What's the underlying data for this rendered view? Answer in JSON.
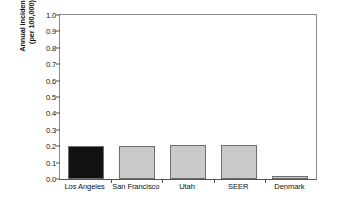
{
  "chart_data": {
    "type": "bar",
    "title": "",
    "xlabel": "",
    "ylabel": "Annual incidence (per 100,000)",
    "ylabel_line1": "Annual incidence",
    "ylabel_line2": "(per 100,000)",
    "categories": [
      "Los Angeles",
      "San Francisco",
      "Utah",
      "SEER",
      "Denmark"
    ],
    "values": [
      0.2,
      0.2,
      0.205,
      0.21,
      0.02
    ],
    "ylim": [
      0.0,
      1.0
    ],
    "ytick_labels": [
      "0.0",
      "0.1",
      "0.2",
      "0.3",
      "0.4",
      "0.5",
      "0.6",
      "0.7",
      "0.8",
      "0.9",
      "1.0"
    ],
    "ytick_values": [
      0.0,
      0.1,
      0.2,
      0.3,
      0.4,
      0.5,
      0.6,
      0.7,
      0.8,
      0.9,
      1.0
    ],
    "grid": false,
    "legend": null,
    "bar_colors": [
      "#121212",
      "#c9c9c9",
      "#c9c9c9",
      "#c9c9c9",
      "#c9c9c9"
    ],
    "bar_edge_color": "#6e6e6e",
    "axis_color": "#555555",
    "background": "#ffffff"
  }
}
